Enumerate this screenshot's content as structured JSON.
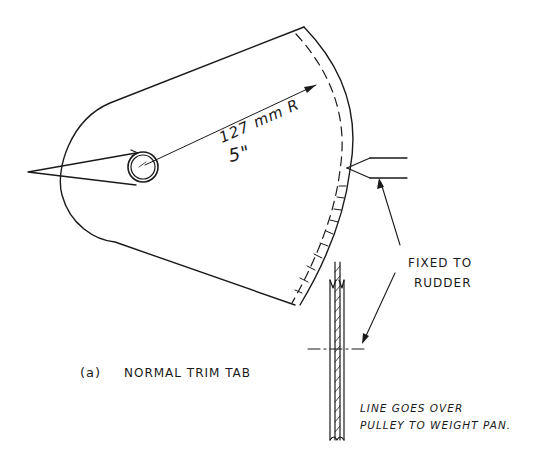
{
  "diagram": {
    "caption_letter": "(a)",
    "caption_text": "NORMAL TRIM TAB",
    "dimension": {
      "metric": "127 mm R",
      "imperial": "5\""
    },
    "annotations": {
      "fixed_to_line1": "FIXED TO",
      "fixed_to_line2": "RUDDER",
      "line_note_line1": "LINE GOES OVER",
      "line_note_line2": "PULLEY TO WEIGHT PAN."
    },
    "colors": {
      "ink": "#1a1a1a",
      "paper": "#ffffff"
    }
  }
}
